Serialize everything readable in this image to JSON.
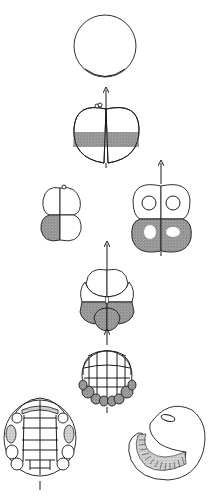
{
  "diagram": {
    "type": "embryonic-cleavage-stages",
    "background": "#ffffff",
    "line_color": "#1a1a1a",
    "stipple_color": "#8a8a8a",
    "stages": [
      {
        "id": "zygote",
        "description": "uncleaved egg with shaded vegetal crescent"
      },
      {
        "id": "two-cell",
        "description": "2-cell stage with shaded equatorial band and polar bodies"
      },
      {
        "id": "four-cell",
        "description": "4-cell stage, one blastomere shaded (D quadrant)"
      },
      {
        "id": "four-cell-nuclei",
        "description": "4-cell with nuclei, lower pair shaded"
      },
      {
        "id": "eight-cell",
        "description": "8-cell stage, vegetal tier shaded"
      },
      {
        "id": "sixteen-plus",
        "description": "multicell stage with shaded vegetal ring"
      },
      {
        "id": "morula",
        "description": "many-celled embryo with lightly shaded lateral cells"
      },
      {
        "id": "larva",
        "description": "curved larva with segmented ventral band"
      }
    ],
    "axis_arrows": 7
  }
}
